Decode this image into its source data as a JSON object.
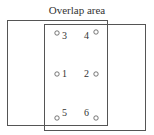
{
  "diagram": {
    "title": "Overlap area",
    "rect_left": {
      "x": 7.5,
      "y": 20.5,
      "w": 100,
      "h": 105
    },
    "rect_right": {
      "x": 44.5,
      "y": 24.5,
      "w": 101,
      "h": 106
    },
    "stroke_color": "#555555",
    "points": [
      {
        "id": "3",
        "label": "3",
        "cx": 57,
        "cy": 33,
        "lx": 62,
        "ly": 39
      },
      {
        "id": "4",
        "label": "4",
        "cx": 96,
        "cy": 32,
        "lx": 84,
        "ly": 39
      },
      {
        "id": "1",
        "label": "1",
        "cx": 57,
        "cy": 74,
        "lx": 62,
        "ly": 77
      },
      {
        "id": "2",
        "label": "2",
        "cx": 96,
        "cy": 74,
        "lx": 84,
        "ly": 77
      },
      {
        "id": "5",
        "label": "5",
        "cx": 57,
        "cy": 118,
        "lx": 62,
        "ly": 116
      },
      {
        "id": "6",
        "label": "6",
        "cx": 96,
        "cy": 118,
        "lx": 84,
        "ly": 116
      }
    ]
  }
}
